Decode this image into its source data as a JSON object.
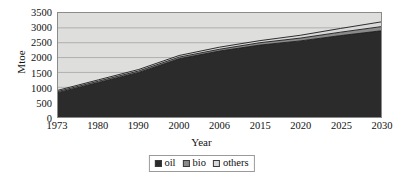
{
  "chart_data": {
    "type": "area",
    "stacked": true,
    "title": "",
    "xlabel": "Year",
    "ylabel": "Mtoe",
    "categories": [
      "1973",
      "1980",
      "1990",
      "2000",
      "2006",
      "2015",
      "2020",
      "2025",
      "2030"
    ],
    "x": [
      1973,
      1980,
      1990,
      2000,
      2006,
      2015,
      2020,
      2025,
      2030
    ],
    "series": [
      {
        "name": "oil",
        "color": "#2b2b2b",
        "values": [
          820,
          1160,
          1500,
          1960,
          2220,
          2420,
          2560,
          2740,
          2900
        ]
      },
      {
        "name": "bio",
        "color": "#8a8a8a",
        "values": [
          40,
          45,
          50,
          55,
          60,
          80,
          95,
          115,
          140
        ]
      },
      {
        "name": "others",
        "color": "#d9d9d9",
        "values": [
          40,
          45,
          50,
          55,
          70,
          70,
          95,
          125,
          160
        ]
      }
    ],
    "totals": [
      900,
      1250,
      1600,
      2070,
      2350,
      2570,
      2750,
      2980,
      3200
    ],
    "ylim": [
      0,
      3500
    ],
    "ytick_step": 500,
    "yticks": [
      "0",
      "500",
      "1000",
      "1500",
      "2000",
      "2500",
      "3000",
      "3500"
    ],
    "grid": true,
    "grid_color": "#9a9a9a",
    "plot_background": "#dededd",
    "legend_position": "bottom-center",
    "legend_entries": [
      "oil",
      "bio",
      "others"
    ]
  },
  "axes": {
    "y_title": "Mtoe",
    "x_title": "Year"
  }
}
